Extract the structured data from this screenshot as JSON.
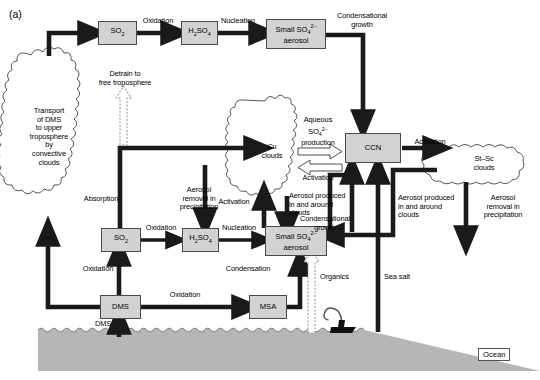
{
  "figure": {
    "panel_label": "(a)",
    "caption_hidden": "",
    "colors": {
      "box_fill": "#d2d2d2",
      "box_border": "#4a4a4a",
      "arrow_solid": "#1a1a1a",
      "arrow_dotted": "#9a9a9a",
      "ocean_fill": "#b6b6b6",
      "cloud_stroke": "#333333",
      "background": "#ffffff"
    }
  },
  "boxes": [
    {
      "id": "so2-upper",
      "label": "SO2",
      "html": "SO<sub>2</sub>"
    },
    {
      "id": "h2so4-upper",
      "label": "H2SO4",
      "html": "H<sub>2</sub>SO<sub>4</sub>"
    },
    {
      "id": "aerosol-upper",
      "label": "Small SO4 2- aerosol",
      "html": "Small SO<sub>4</sub><sup>2&#8722;</sup><br>aerosol"
    },
    {
      "id": "ccn",
      "label": "CCN",
      "html": "CCN"
    },
    {
      "id": "so2-lower",
      "label": "SO2",
      "html": "SO<sub>2</sub>"
    },
    {
      "id": "h2so4-lower",
      "label": "H2SO4",
      "html": "H<sub>2</sub>SO<sub>4</sub>"
    },
    {
      "id": "aerosol-lower",
      "label": "Small SO4 2- aerosol",
      "html": "Small SO<sub>4</sub><sup>2&#8722;</sup><br>aerosol"
    },
    {
      "id": "dms",
      "label": "DMS",
      "html": "DMS"
    },
    {
      "id": "msa",
      "label": "MSA",
      "html": "MSA"
    }
  ],
  "clouds": [
    {
      "id": "transport-cloud",
      "label": "Transport\nof DMS\nto upper\ntroposphere\nby\nconvective\nclouds"
    },
    {
      "id": "cu-cloud",
      "label": "Cu\nclouds"
    },
    {
      "id": "stsc-cloud",
      "label": "St–Sc\nclouds"
    }
  ],
  "process_labels": [
    {
      "id": "oxidation-upper",
      "text": "Oxidation"
    },
    {
      "id": "nucleation-upper",
      "text": "Nucleation"
    },
    {
      "id": "condensational-growth-upper",
      "text": "Condensational\ngrowth"
    },
    {
      "id": "detrain",
      "text": "Detrain to\nfree troposphere"
    },
    {
      "id": "aqueous-production",
      "text": "Aqueous\nSO4 2-\nproduction"
    },
    {
      "id": "activation-cu",
      "text": "Activation"
    },
    {
      "id": "activation-ccn",
      "text": "Activation"
    },
    {
      "id": "aerosol-removal-left",
      "text": "Aerosol\nremoval in\nprecipitation"
    },
    {
      "id": "activation-lower",
      "text": "Activation"
    },
    {
      "id": "aerosol-produced-cu",
      "text": "Aerosol produced\nin and around\nclouds"
    },
    {
      "id": "condensational-growth-lower",
      "text": "Condensational\ngrowth"
    },
    {
      "id": "aerosol-produced-stsc",
      "text": "Aerosol produced\nin and around\nclouds"
    },
    {
      "id": "aerosol-removal-right",
      "text": "Aerosol\nremoval in\nprecipitation"
    },
    {
      "id": "absorption",
      "text": "Absorption"
    },
    {
      "id": "oxidation-lower",
      "text": "Oxidation"
    },
    {
      "id": "nucleation-lower",
      "text": "Nucleation"
    },
    {
      "id": "oxidation-dms-so2",
      "text": "Oxidation"
    },
    {
      "id": "oxidation-dms-msa",
      "text": "Oxidation"
    },
    {
      "id": "condensation",
      "text": "Condensation"
    },
    {
      "id": "organics",
      "text": "Organics"
    },
    {
      "id": "sea-salt",
      "text": "Sea salt"
    },
    {
      "id": "dms-flux",
      "text": "DMS"
    }
  ],
  "aqueous_label_html": "Aqueous<br>SO<sub>4</sub><sup>2&#8722;</sup><br>production",
  "ocean": {
    "label": "Ocean"
  },
  "ship": {
    "name": "ship-with-plume"
  }
}
